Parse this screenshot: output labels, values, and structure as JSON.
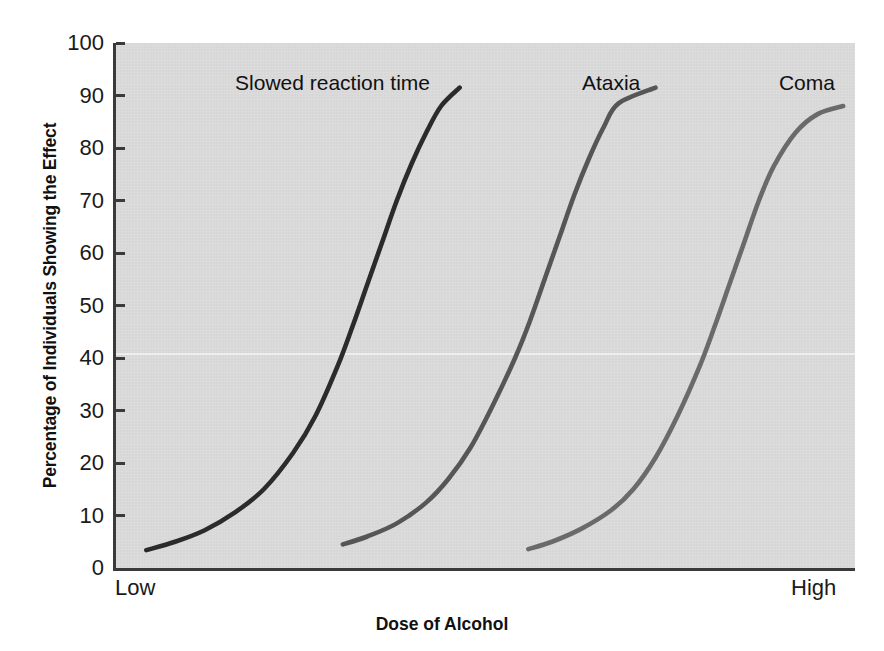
{
  "chart_data": {
    "type": "line",
    "title": "",
    "xlabel": "Dose of Alcohol",
    "ylabel": "Percentage of Individuals Showing the Effect",
    "ylim": [
      0,
      100
    ],
    "yticks": [
      0,
      10,
      20,
      30,
      40,
      50,
      60,
      70,
      80,
      90,
      100
    ],
    "ytick_labels": [
      "0",
      "10",
      "20",
      "30",
      "40",
      "50",
      "60",
      "70",
      "80",
      "90",
      "100"
    ],
    "xlim": [
      0,
      100
    ],
    "xtick_labels": [
      "Low",
      "High"
    ],
    "grid": false,
    "legend_position": "inline-annotations",
    "background_color": "#d7d7d7",
    "series": [
      {
        "name": "Slowed reaction time",
        "color": "#2b2b2b",
        "label_x_pct": 29.3,
        "label_y_px": 72,
        "x": [
          4.1,
          8.0,
          12.0,
          16.0,
          20.0,
          24.0,
          27.0,
          30.0,
          32.0,
          34.0,
          36.0,
          38.0,
          40.0,
          42.0,
          44.0,
          46.5
        ],
        "y": [
          3.4,
          5.0,
          7.2,
          10.5,
          15.0,
          22.0,
          29.0,
          38.5,
          46.0,
          54.0,
          62.0,
          70.0,
          77.0,
          83.0,
          88.0,
          91.5
        ]
      },
      {
        "name": "Ataxia",
        "color": "#565656",
        "label_x_pct": 67.0,
        "label_y_px": 72,
        "x": [
          30.7,
          34.0,
          38.0,
          42.0,
          45.0,
          48.0,
          51.0,
          54.0,
          56.0,
          58.0,
          60.0,
          62.0,
          64.0,
          66.0,
          68.0,
          73.0
        ],
        "y": [
          4.5,
          6.0,
          8.5,
          12.5,
          17.0,
          23.0,
          31.0,
          40.0,
          47.0,
          55.0,
          63.0,
          71.0,
          78.0,
          84.0,
          88.5,
          91.5
        ]
      },
      {
        "name": "Coma",
        "color": "#6a6a6a",
        "label_x_pct": 93.5,
        "label_y_px": 72,
        "x": [
          55.8,
          59.0,
          63.0,
          67.0,
          70.0,
          73.0,
          76.0,
          79.0,
          81.0,
          83.0,
          85.0,
          87.0,
          89.0,
          92.0,
          95.0,
          98.4
        ],
        "y": [
          3.6,
          5.0,
          7.5,
          11.0,
          15.0,
          21.0,
          29.0,
          38.5,
          46.0,
          54.0,
          62.0,
          70.0,
          76.5,
          83.0,
          86.5,
          88.0
        ]
      }
    ],
    "artifact_scanline_y_pct": 41
  }
}
